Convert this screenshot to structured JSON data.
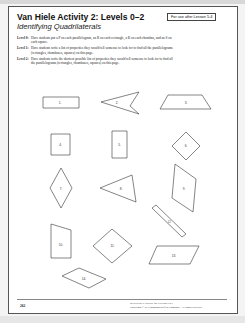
{
  "header": {
    "title": "Van Hiele Activity 2: Levels 0–2",
    "subtitle": "Identifying Quadrilaterals",
    "badge": "For use after Lesson 5-4"
  },
  "levels": [
    {
      "name": "Level 0:",
      "text": "Have students put a P on each parallelogram, an R on each rectangle, a B on each rhombus, and an S on each square."
    },
    {
      "name": "Level 1:",
      "text": "Have students write a list of properties they would tell someone to look for to find all the parallelograms (rectangles, rhombuses, squares) on this page."
    },
    {
      "name": "Level 2:",
      "text": "Have students write the shortest possible list of properties they would tell someone to look for to find all the parallelograms (rectangles, rhombuses, squares) on this page."
    }
  ],
  "shapes": [
    {
      "label": "1.",
      "kind": "rectangle"
    },
    {
      "label": "2.",
      "kind": "concave-quadrilateral"
    },
    {
      "label": "3.",
      "kind": "trapezoid"
    },
    {
      "label": "4.",
      "kind": "square"
    },
    {
      "label": "5.",
      "kind": "rectangle"
    },
    {
      "label": "6.",
      "kind": "square-rotated"
    },
    {
      "label": "7.",
      "kind": "rhombus"
    },
    {
      "label": "8.",
      "kind": "kite"
    },
    {
      "label": "9.",
      "kind": "parallelogram"
    },
    {
      "label": "10.",
      "kind": "trapezoid"
    },
    {
      "label": "11.",
      "kind": "square-rotated"
    },
    {
      "label": "12.",
      "kind": "thin-rectangle"
    },
    {
      "label": "13.",
      "kind": "parallelogram"
    },
    {
      "label": "14.",
      "kind": "parallelogram"
    }
  ],
  "footer": {
    "page_number": "262",
    "book": "RESOURCE BOOK for GEOMETRY",
    "copyright": "Copyright © by Houghton Mifflin Company. All rights reserved."
  }
}
